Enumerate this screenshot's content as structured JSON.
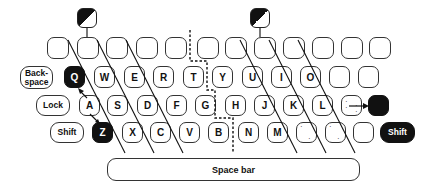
{
  "diagram": {
    "title": "",
    "row_top": {
      "keys": [
        "",
        "",
        "",
        "",
        "",
        "",
        "",
        "",
        "",
        "",
        "",
        ""
      ]
    },
    "row_q": {
      "modifier": "Back-\nspace",
      "keys": [
        "Q",
        "W",
        "E",
        "R",
        "T",
        "Y",
        "U",
        "I",
        "O",
        "",
        ""
      ]
    },
    "row_a": {
      "modifier": "Lock",
      "keys": [
        "A",
        "S",
        "D",
        "F",
        "G",
        "H",
        "J",
        "K",
        "L",
        "",
        ""
      ]
    },
    "row_z": {
      "modifier": "Shift",
      "keys": [
        "Z",
        "X",
        "C",
        "V",
        "B",
        "N",
        "M",
        "",
        "",
        ""
      ],
      "right_modifier": "Shift"
    },
    "space_bar": "Space bar",
    "highlighted_keys": [
      "Q",
      "Z",
      "right-of-semicolon",
      "Shift (right)"
    ],
    "half_shaded_keys": 2,
    "colors": {
      "ink": "#111111",
      "background": "#ffffff"
    }
  }
}
